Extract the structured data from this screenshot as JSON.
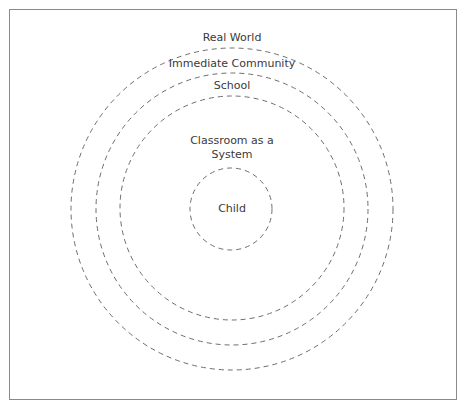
{
  "diagram": {
    "type": "concentric-circles",
    "stroke_color": "#6e6e6e",
    "stroke_style": "dashed",
    "center": {
      "x": 232,
      "y": 209
    },
    "layers": [
      {
        "label": "Real World",
        "radius": 161,
        "label_pos": {
          "x": 232,
          "y": 31
        }
      },
      {
        "label": "Immediate Community",
        "radius": 136,
        "label_pos": {
          "x": 232,
          "y": 57
        }
      },
      {
        "label": "School",
        "radius": 112,
        "label_pos": {
          "x": 232,
          "y": 79
        }
      },
      {
        "label": "Classroom as a System",
        "radius": 0,
        "label_pos": {
          "x": 232,
          "y": 134
        }
      },
      {
        "label": "Child",
        "radius": 41,
        "label_pos": {
          "x": 232,
          "y": 202
        }
      }
    ]
  }
}
